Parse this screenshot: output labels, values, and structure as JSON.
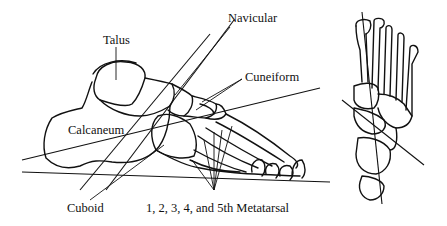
{
  "figure": {
    "type": "anatomical line drawing",
    "stroke_color": "#111111",
    "background": "#ffffff"
  },
  "labels": {
    "talus": "Talus",
    "navicular": "Navicular",
    "cuneiform": "Cuneiform",
    "calcaneum": "Calcaneum",
    "cuboid": "Cuboid",
    "metatarsal": "1, 2, 3, 4, and 5th Metatarsal"
  },
  "views": {
    "lateral": "lateral-view-foot",
    "dorsal": "dorsal-view-foot"
  }
}
